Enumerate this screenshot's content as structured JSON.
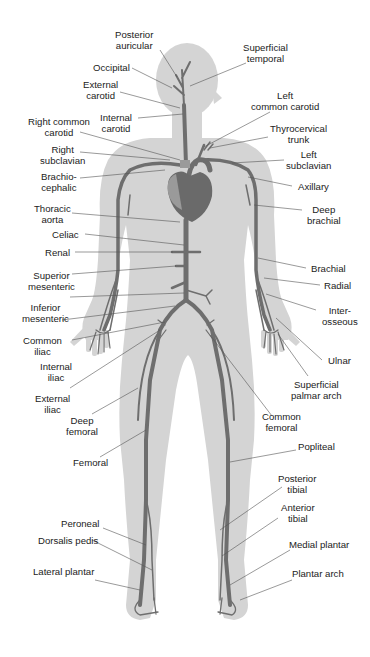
{
  "diagram": {
    "colors": {
      "background": "#ffffff",
      "body_silhouette": "#d4d4d4",
      "artery": "#6e6e6e",
      "heart": "#6a6a6a",
      "heart_light": "#9a9a9a",
      "leader_line": "#555555",
      "text": "#222222"
    },
    "labels": {
      "posterior_auricular": "Posterior\nauricular",
      "occipital": "Occipital",
      "external_carotid": "External\ncarotid",
      "internal_carotid": "Internal\ncarotid",
      "right_common_carotid": "Right common\ncarotid",
      "right_subclavian": "Right\nsubclavian",
      "brachiocephalic": "Brachio-\ncephalic",
      "thoracic_aorta": "Thoracic\naorta",
      "celiac": "Celiac",
      "renal": "Renal",
      "superior_mesenteric": "Superior\nmesenteric",
      "inferior_mesenteric": "Inferior\nmesenteric",
      "common_iliac": "Common\niliac",
      "internal_iliac": "Internal\niliac",
      "external_iliac": "External\niliac",
      "deep_femoral": "Deep\nfemoral",
      "femoral": "Femoral",
      "peroneal": "Peroneal",
      "dorsalis_pedis": "Dorsalis pedis",
      "lateral_plantar": "Lateral plantar",
      "superficial_temporal": "Superficial\ntemporal",
      "left_common_carotid": "Left\ncommon carotid",
      "thyrocervical_trunk": "Thyrocervical\ntrunk",
      "left_subclavian": "Left\nsubclavian",
      "axillary": "Axillary",
      "deep_brachial": "Deep\nbrachial",
      "brachial": "Brachial",
      "radial": "Radial",
      "interosseous": "Inter-\nosseous",
      "ulnar": "Ulnar",
      "superficial_palmar_arch": "Superficial\npalmar arch",
      "common_femoral": "Common\nfemoral",
      "popliteal": "Popliteal",
      "posterior_tibial": "Posterior\ntibial",
      "anterior_tibial": "Anterior\ntibial",
      "medial_plantar": "Medial plantar",
      "plantar_arch": "Plantar arch"
    }
  }
}
